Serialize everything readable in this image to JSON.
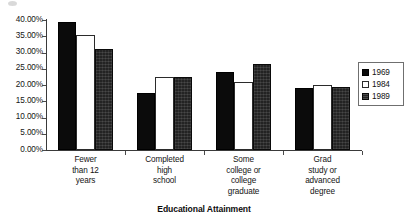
{
  "chart_data": {
    "type": "bar",
    "title": "",
    "xlabel": "Educational Attainment",
    "ylabel": "",
    "categories": [
      "Fewer\nthan 12\nyears",
      "Completed\nhigh\nschool",
      "Some\ncollege or\ncollege\ngraduate",
      "Grad\nstudy  or\nadvanced\ndegree"
    ],
    "series": [
      {
        "name": "1969",
        "color": "#0b0b0b",
        "values": [
          39.5,
          17.5,
          24.0,
          19.0
        ]
      },
      {
        "name": "1984",
        "color": "#ffffff",
        "values": [
          35.5,
          22.5,
          21.0,
          20.0
        ]
      },
      {
        "name": "1989",
        "color": "#232323",
        "values": [
          31.0,
          22.5,
          26.5,
          19.5
        ]
      }
    ],
    "ylim": [
      0,
      40
    ],
    "ytick_values": [
      0,
      5,
      10,
      15,
      20,
      25,
      30,
      35,
      40
    ],
    "ytick_labels": [
      "0.00%",
      "5.00%",
      "10.00%",
      "15.00%",
      "20.00%",
      "25.00%",
      "30.00%",
      "35.00%",
      "40.00%"
    ],
    "grid": false,
    "legend_position": "right"
  },
  "legend": {
    "entries": [
      {
        "label": "1969"
      },
      {
        "label": "1984"
      },
      {
        "label": "1989"
      }
    ]
  },
  "axis": {
    "x_title": "Educational Attainment"
  }
}
